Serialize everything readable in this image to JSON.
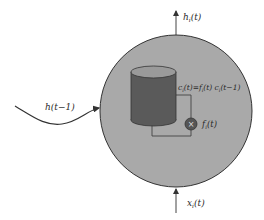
{
  "diagram": {
    "type": "lstm-memory-cell",
    "labels": {
      "output": "h",
      "output_sub": "i",
      "output_arg": "(t)",
      "input": "x",
      "input_sub": "i",
      "input_arg": "(t)",
      "prev_hidden": "h(t−1)",
      "cell_eq_c": "c",
      "cell_eq_sub1": "i",
      "cell_eq_mid": "(t)=f",
      "cell_eq_sub2": "i",
      "cell_eq_mid2": "(t) c",
      "cell_eq_sub3": "i",
      "cell_eq_end": "(t−1)",
      "gate": "f",
      "gate_sub": "i",
      "gate_arg": "(t)",
      "multiply_symbol": "×"
    },
    "colors": {
      "cell_circle": "#a9a9a9",
      "cylinder_body": "#5a5a5a",
      "cylinder_top": "#9a9a9a",
      "gate_node": "#555555",
      "lines": "#333333",
      "background": "#ffffff"
    }
  }
}
